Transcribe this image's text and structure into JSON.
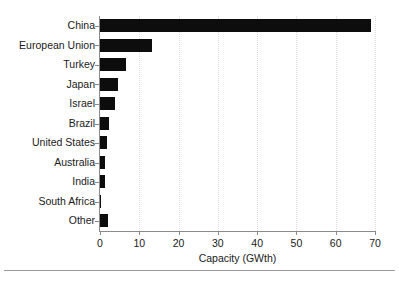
{
  "chart_data": {
    "type": "bar",
    "orientation": "horizontal",
    "title": "",
    "xlabel": "Capacity (GWth)",
    "ylabel": "",
    "xlim": [
      0,
      70
    ],
    "xticks": [
      0,
      10,
      20,
      30,
      40,
      50,
      60,
      70
    ],
    "grid": "vertical-dotted-light",
    "legend": "none",
    "bar_color": "#0d0d0d",
    "categories": [
      "China",
      "European Union",
      "Turkey",
      "Japan",
      "Israel",
      "Brazil",
      "United States",
      "Australia",
      "India",
      "South Africa",
      "Other"
    ],
    "values": [
      69,
      13.3,
      6.7,
      4.6,
      3.9,
      2.3,
      1.9,
      1.2,
      1.2,
      0.1,
      2.1
    ],
    "series": [
      {
        "name": "Capacity",
        "values": [
          69,
          13.3,
          6.7,
          4.6,
          3.9,
          2.3,
          1.9,
          1.2,
          1.2,
          0.1,
          2.1
        ]
      }
    ]
  },
  "axis": {
    "x_title": "Capacity (GWth)",
    "tick_labels": [
      "0",
      "10",
      "20",
      "30",
      "40",
      "50",
      "60",
      "70"
    ]
  },
  "categories": [
    {
      "label": "China"
    },
    {
      "label": "European Union"
    },
    {
      "label": "Turkey"
    },
    {
      "label": "Japan"
    },
    {
      "label": "Israel"
    },
    {
      "label": "Brazil"
    },
    {
      "label": "United States"
    },
    {
      "label": "Australia"
    },
    {
      "label": "India"
    },
    {
      "label": "South Africa"
    },
    {
      "label": "Other"
    }
  ],
  "colors": {
    "bar": "#0d0d0d",
    "axis": "#8a8a8a",
    "grid": "#dcdcdc",
    "text": "#1a1a1a",
    "background": "#ffffff"
  }
}
